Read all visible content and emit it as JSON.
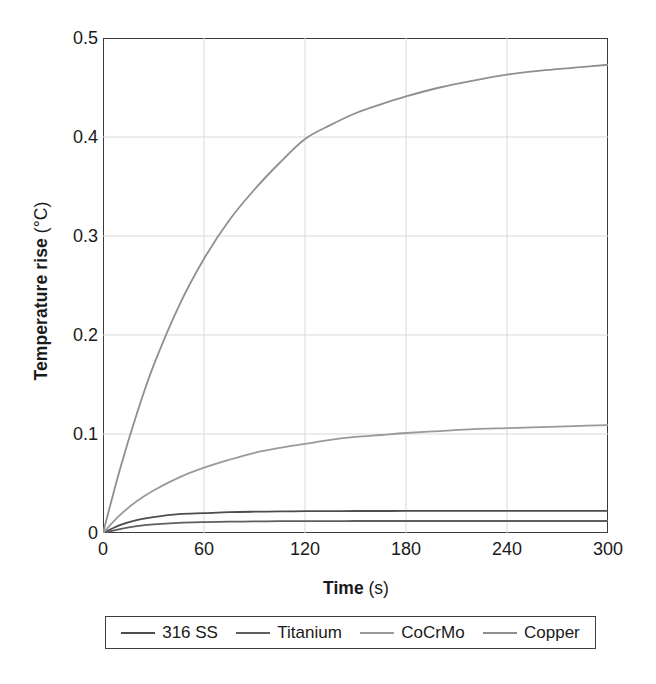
{
  "chart_data": {
    "type": "line",
    "title": "",
    "xlabel": "Time",
    "xlabel_unit": "(s)",
    "ylabel": "Temperature rise",
    "ylabel_unit": "(°C)",
    "xlim": [
      0,
      300
    ],
    "ylim": [
      0,
      0.5
    ],
    "xticks": [
      "0",
      "60",
      "120",
      "180",
      "240",
      "300"
    ],
    "xtick_values": [
      0,
      60,
      120,
      180,
      240,
      300
    ],
    "yticks": [
      "0",
      "0.1",
      "0.2",
      "0.3",
      "0.4",
      "0.5"
    ],
    "ytick_values": [
      0,
      0.1,
      0.2,
      0.3,
      0.4,
      0.5
    ],
    "grid": true,
    "grid_color": "#d9d9d9",
    "frame_color": "#3b3b3b",
    "legend_position": "below-plot",
    "x": [
      0,
      10,
      20,
      30,
      45,
      60,
      75,
      90,
      105,
      120,
      135,
      150,
      165,
      180,
      200,
      220,
      240,
      260,
      280,
      300
    ],
    "series": [
      {
        "name": "316 SS",
        "color": "#4d4d4d",
        "values": [
          0.0,
          0.008,
          0.013,
          0.016,
          0.019,
          0.02,
          0.021,
          0.0215,
          0.0218,
          0.022,
          0.0221,
          0.0222,
          0.0222,
          0.0223,
          0.0223,
          0.0223,
          0.0223,
          0.0223,
          0.0223,
          0.0223
        ]
      },
      {
        "name": "Titanium",
        "color": "#5e5e5e",
        "values": [
          0.0,
          0.004,
          0.007,
          0.0088,
          0.0103,
          0.011,
          0.0114,
          0.0117,
          0.0119,
          0.012,
          0.012,
          0.0121,
          0.0121,
          0.0121,
          0.0121,
          0.0121,
          0.0121,
          0.0121,
          0.0121,
          0.0121
        ]
      },
      {
        "name": "CoCrMo",
        "color": "#9a9a9a",
        "values": [
          0.0,
          0.018,
          0.032,
          0.043,
          0.056,
          0.066,
          0.074,
          0.081,
          0.086,
          0.09,
          0.094,
          0.097,
          0.099,
          0.101,
          0.103,
          0.105,
          0.106,
          0.107,
          0.108,
          0.109
        ]
      },
      {
        "name": "Copper",
        "color": "#8f8f8f",
        "values": [
          0.0,
          0.064,
          0.12,
          0.169,
          0.229,
          0.277,
          0.316,
          0.347,
          0.374,
          0.398,
          0.412,
          0.424,
          0.433,
          0.441,
          0.45,
          0.457,
          0.463,
          0.467,
          0.47,
          0.473
        ]
      }
    ]
  },
  "legend": {
    "entries": [
      {
        "label": "316 SS"
      },
      {
        "label": "Titanium"
      },
      {
        "label": "CoCrMo"
      },
      {
        "label": "Copper"
      }
    ]
  }
}
